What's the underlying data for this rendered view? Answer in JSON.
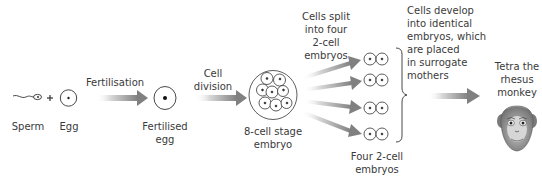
{
  "diagram": {
    "type": "process-flow",
    "colors": {
      "arrow_start": "#f2f2f2",
      "arrow_end": "#7a7a7a",
      "stroke": "#333333",
      "text": "#3a3a3a"
    },
    "nodes": {
      "sperm": {
        "label": "Sperm",
        "icon": "sperm-icon"
      },
      "plus": {
        "label": "+"
      },
      "egg": {
        "label": "Egg",
        "icon": "egg-cell-icon"
      },
      "fertilised_egg": {
        "label_lines": [
          "Fertilised",
          "egg"
        ],
        "icon": "fertilised-egg-icon"
      },
      "eight_cell": {
        "label_lines": [
          "8-cell stage",
          "embryo"
        ],
        "icon": "eight-cell-embryo-icon"
      },
      "two_cell_group": {
        "label_lines": [
          "Four 2-cell",
          "embryos"
        ],
        "count": 4,
        "icon": "two-cell-embryo-icon"
      },
      "monkey": {
        "label_lines": [
          "Tetra the",
          "rhesus",
          "monkey"
        ],
        "icon": "rhesus-monkey-face-icon"
      }
    },
    "steps": {
      "fertilisation": {
        "label": "Fertilisation"
      },
      "cell_division": {
        "label_lines": [
          "Cell",
          "division"
        ]
      },
      "split": {
        "label_lines": [
          "Cells split",
          "into four",
          "2-cell",
          "embryos"
        ]
      },
      "develop": {
        "label_lines": [
          "Cells develop",
          "into identical",
          "embryos, which",
          "are placed",
          "in surrogate",
          "mothers"
        ]
      }
    }
  }
}
